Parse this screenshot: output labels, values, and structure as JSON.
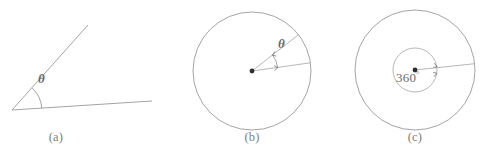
{
  "figure": {
    "background_color": "#ffffff",
    "line_color": "#9a9a9a",
    "text_color": "#6b6b6b",
    "dot_color": "#2e2e2e",
    "panels": [
      {
        "id": "a",
        "caption": "(a)",
        "kind": "angle-between-two-rays",
        "angle_label": "θ",
        "vertex": {
          "x": 12,
          "y": 110
        },
        "rays": [
          {
            "name": "upper-ray",
            "to_x": 88,
            "to_y": 25
          },
          {
            "name": "lower-ray",
            "to_x": 152,
            "to_y": 101
          }
        ],
        "arc_radius": 30
      },
      {
        "id": "b",
        "caption": "(b)",
        "kind": "circle-with-central-angle",
        "angle_label": "θ",
        "center": {
          "x": 252,
          "y": 71
        },
        "radius": 59,
        "radii": [
          {
            "name": "upper-radius",
            "angle_deg": 38
          },
          {
            "name": "lower-radius",
            "angle_deg": 8
          }
        ],
        "arc_radius": 26,
        "arrowheads": 2
      },
      {
        "id": "c",
        "caption": "(c)",
        "kind": "circle-with-full-turn",
        "angle_label": "360",
        "angle_unit": "°",
        "center": {
          "x": 415,
          "y": 70
        },
        "outer_radius": 60,
        "inner_radius": 22,
        "radii": [
          {
            "name": "right-radius",
            "angle_deg": 6
          }
        ],
        "arrowheads": 2
      }
    ]
  }
}
